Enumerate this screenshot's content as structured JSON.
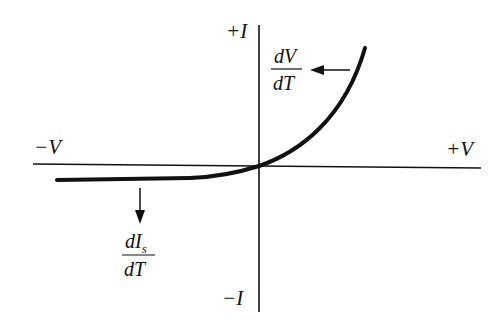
{
  "diagram": {
    "axes": {
      "positive_current_label": "+I",
      "negative_current_label": "−I",
      "negative_voltage_label": "−V",
      "positive_voltage_label": "+V"
    },
    "annotations": {
      "forward": {
        "numerator": "dV",
        "denominator": "dT",
        "arrow_direction": "left"
      },
      "reverse": {
        "numerator": "dI",
        "numerator_subscript": "s",
        "denominator": "dT",
        "arrow_direction": "down"
      }
    },
    "colors": {
      "ink": "#111111",
      "background": "#ffffff"
    }
  }
}
